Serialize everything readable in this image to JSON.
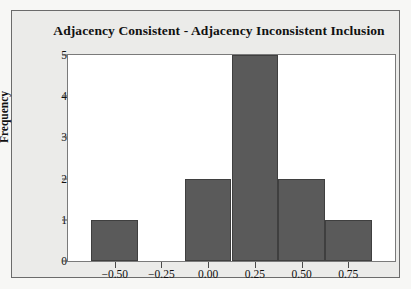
{
  "chart_data": {
    "type": "bar",
    "title": "Adjacency Consistent - Adjacency Inconsistent Inclusion",
    "xlabel": "",
    "ylabel": "Frequency",
    "categories": [
      "-0.50",
      "-0.25",
      "0.00",
      "0.25",
      "0.50",
      "0.75"
    ],
    "x": [
      -0.5,
      -0.25,
      0.0,
      0.25,
      0.5,
      0.75
    ],
    "values": [
      1,
      0,
      2,
      5,
      2,
      1
    ],
    "bin_width": 0.25,
    "ylim": [
      0,
      5
    ],
    "yticks": [
      "0",
      "1",
      "2",
      "3",
      "4",
      "5"
    ],
    "xticks": [
      "−0.50",
      "−0.25",
      "0.00",
      "0.25",
      "0.50",
      "0.75"
    ],
    "grid": false,
    "legend": false,
    "bar_color": "#5a5a5a",
    "bar_edge_color": "#3f3f3f",
    "plot_background": "#ffffff",
    "panel_background": "#ebebe9"
  }
}
